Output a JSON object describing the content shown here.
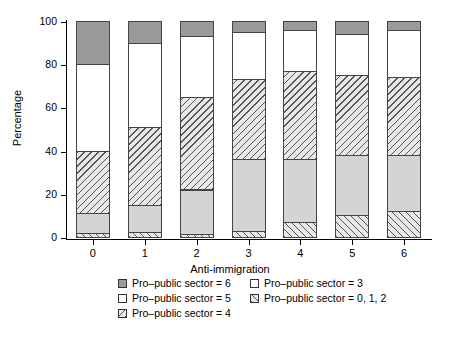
{
  "chart_data": {
    "type": "bar",
    "subtype": "stacked-bar-100",
    "title": "",
    "xlabel": "Anti-immigration",
    "ylabel": "Percentage",
    "categories": [
      "0",
      "1",
      "2",
      "3",
      "4",
      "5",
      "6"
    ],
    "ylim": [
      0,
      100
    ],
    "yticks": [
      0,
      20,
      40,
      60,
      80,
      100
    ],
    "ytick_labels": [
      "0",
      "20",
      "40",
      "60",
      "80",
      "100"
    ],
    "grid": false,
    "legend_position": "below-plot",
    "stack_order_bottom_to_top": [
      "Pro-public sector = 0, 1, 2",
      "Pro-public sector = 3",
      "Pro-public sector = 4",
      "Pro-public sector = 5",
      "Pro-public sector = 6"
    ],
    "series": [
      {
        "name": "Pro-public sector = 0, 1, 2",
        "fill": "hatch-forward",
        "values": [
          2,
          2.5,
          1.5,
          3,
          7,
          10,
          12
        ]
      },
      {
        "name": "Pro-public sector = 3",
        "fill": "solid-light-gray",
        "values": [
          9,
          12.5,
          20.5,
          33,
          29,
          28,
          26
        ]
      },
      {
        "name": "Pro-public sector = 4",
        "fill": "hatch-back",
        "values": [
          29,
          36,
          43,
          37,
          41,
          37,
          36
        ]
      },
      {
        "name": "Pro-public sector = 5",
        "fill": "white",
        "values": [
          40,
          39,
          28,
          22,
          19,
          19,
          22
        ]
      },
      {
        "name": "Pro-public sector = 6",
        "fill": "solid-dark-gray",
        "values": [
          20,
          10,
          7,
          5,
          4,
          6,
          4
        ]
      }
    ],
    "cumulative_tops": {
      "0": [
        2,
        11,
        40,
        80,
        100
      ],
      "1": [
        2.5,
        15,
        51,
        90,
        100
      ],
      "2": [
        1.5,
        22,
        65,
        93,
        100
      ],
      "3": [
        3,
        36,
        73,
        95,
        100
      ],
      "4": [
        7,
        36,
        77,
        96,
        100
      ],
      "5": [
        10,
        38,
        75,
        94,
        100
      ],
      "6": [
        12,
        38,
        74,
        96,
        100
      ]
    }
  },
  "legend": {
    "items": [
      {
        "label": "Pro–public sector = 6",
        "swatch": "solid-dark-gray",
        "column": 1,
        "row": 1
      },
      {
        "label": "Pro–public sector = 3",
        "swatch": "white",
        "column": 2,
        "row": 1
      },
      {
        "label": "Pro–public sector = 5",
        "swatch": "white",
        "column": 1,
        "row": 2
      },
      {
        "label": "Pro–public sector = 0, 1, 2",
        "swatch": "hatch-forward",
        "column": 2,
        "row": 2
      },
      {
        "label": "Pro–public sector = 4",
        "swatch": "hatch-back",
        "column": 1,
        "row": 3
      }
    ]
  },
  "colors": {
    "dark_gray": "#9a9a9a",
    "light_gray": "#d4d4d4",
    "hatch_base": "#e8e8e8",
    "hatch_line": "#555555",
    "outline": "#444444",
    "axis": "#000000",
    "background": "#ffffff"
  }
}
